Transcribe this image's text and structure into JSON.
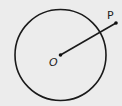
{
  "diagram": {
    "type": "geometry",
    "circle": {
      "cx": 60.5,
      "cy": 55,
      "r": 45.5,
      "stroke": "#1a1a1a"
    },
    "center": {
      "label": "O",
      "x": 60.5,
      "y": 55
    },
    "point": {
      "label": "P",
      "x": 116,
      "y": 23
    },
    "segment": {
      "from": "O",
      "to": "P"
    },
    "background": "#ececec"
  }
}
